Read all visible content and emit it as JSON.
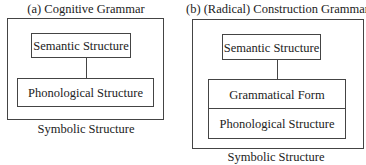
{
  "panels": [
    {
      "title": "(a) Cognitive Grammar",
      "semantic": "Semantic Structure",
      "phonological": "Phonological Structure",
      "caption": "Symbolic Structure"
    },
    {
      "title": "(b) (Radical) Construction Grammar",
      "semantic": "Semantic Structure",
      "grammatical": "Grammatical Form",
      "phonological": "Phonological Structure",
      "caption": "Symbolic Structure"
    }
  ]
}
